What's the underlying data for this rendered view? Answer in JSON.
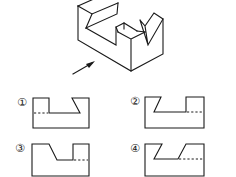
{
  "figure": {
    "view_arrow": "arrow-pointing-upper-right"
  },
  "options": [
    {
      "label": "①",
      "visible_left": "rect-step",
      "visible_right": "slant",
      "hidden_line": "left"
    },
    {
      "label": "②",
      "visible_left": "slant",
      "visible_right": "rect-step",
      "hidden_line": "right"
    },
    {
      "label": "③",
      "visible_left": "slant-down",
      "visible_right": "rect-step",
      "hidden_line": "right"
    },
    {
      "label": "④",
      "visible_left": "slant",
      "visible_right": "slant",
      "hidden_line": "right"
    }
  ]
}
